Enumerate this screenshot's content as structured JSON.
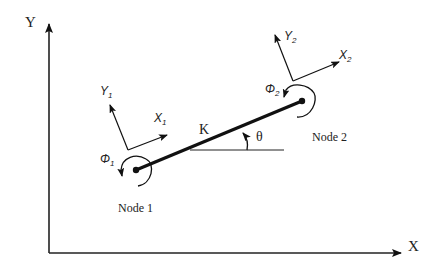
{
  "diagram": {
    "global_axes": {
      "x_label": "X",
      "y_label": "Y"
    },
    "element": {
      "stiffness_label": "K",
      "angle_label": "θ"
    },
    "node1": {
      "label": "Node 1",
      "rotation_label": "Φ",
      "rotation_sub": "1",
      "local_x_label": "X",
      "local_x_sub": "1",
      "local_y_label": "Y",
      "local_y_sub": "1"
    },
    "node2": {
      "label": "Node 2",
      "rotation_label": "Φ",
      "rotation_sub": "2",
      "local_x_label": "X",
      "local_x_sub": "2",
      "local_y_label": "Y",
      "local_y_sub": "2"
    },
    "colors": {
      "line": "#111111",
      "background": "#ffffff"
    }
  }
}
